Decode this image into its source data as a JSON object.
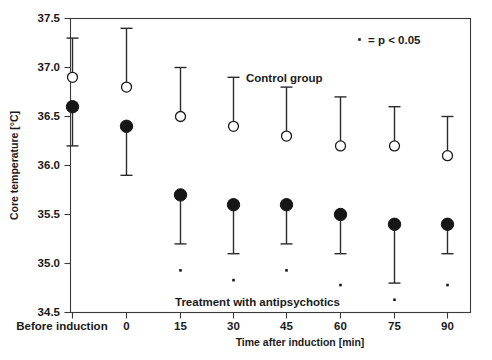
{
  "chart_data": {
    "type": "scatter",
    "title": "",
    "xlabel": "Time after induction [min]",
    "ylabel": "Core temperature [°C]",
    "ylim": [
      34.5,
      37.5
    ],
    "yticks": [
      34.5,
      35.0,
      35.5,
      36.0,
      36.5,
      37.0,
      37.5
    ],
    "ytick_labels": [
      "34.5",
      "35.0",
      "35.5",
      "36.0",
      "36.5",
      "37.0",
      "37.5"
    ],
    "categories": [
      "Before induction",
      "0",
      "15",
      "30",
      "45",
      "60",
      "75",
      "90"
    ],
    "xtick_labels": [
      "Before induction",
      "0",
      "15",
      "30",
      "45",
      "60",
      "75",
      "90"
    ],
    "grid": false,
    "legend_position": "inside",
    "series": [
      {
        "name": "Control group",
        "marker": "open-circle",
        "error_direction": "up",
        "values": [
          36.9,
          36.8,
          36.5,
          36.4,
          36.3,
          36.2,
          36.2,
          36.1
        ],
        "error_high": [
          37.3,
          37.4,
          37.0,
          36.9,
          36.8,
          36.7,
          36.6,
          36.5
        ]
      },
      {
        "name": "Treatment with antipsychotics",
        "marker": "filled-circle",
        "error_direction": "down",
        "values": [
          36.6,
          36.4,
          35.7,
          35.6,
          35.6,
          35.5,
          35.4,
          35.4
        ],
        "error_low": [
          36.2,
          35.9,
          35.2,
          35.1,
          35.2,
          35.1,
          34.8,
          35.1
        ]
      }
    ],
    "significance_marks": {
      "label": "= p < 0.05",
      "points": [
        {
          "category": "15",
          "y": 34.93
        },
        {
          "category": "30",
          "y": 34.83
        },
        {
          "category": "45",
          "y": 34.93
        },
        {
          "category": "60",
          "y": 34.78
        },
        {
          "category": "75",
          "y": 34.63
        },
        {
          "category": "90",
          "y": 34.78
        }
      ]
    },
    "annotations": [
      {
        "name": "control-group-label",
        "text": "Control group"
      },
      {
        "name": "treatment-group-label",
        "text": "Treatment with antipsychotics"
      },
      {
        "name": "significance-legend-label",
        "text": "= p < 0.05"
      }
    ]
  }
}
